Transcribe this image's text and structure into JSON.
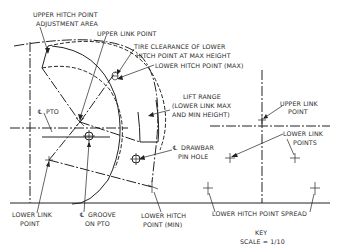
{
  "diagram": {
    "labels": {
      "upper_hitch_adjust_1": "UPPER HITCH POINT",
      "upper_hitch_adjust_2": "ADJUSTMENT AREA",
      "upper_link_point_left": "UPPER LINK POINT",
      "tire_clearance_1": "TIRE CLEARANCE OF LOWER",
      "tire_clearance_2": "HITCH POINT AT MAX HEIGHT",
      "lower_hitch_max": "LOWER HITCH POINT (MAX)",
      "lift_range_1": "LIFT RANGE",
      "lift_range_2": "(LOWER LINK MAX",
      "lift_range_3": "AND MIN HEIGHT)",
      "pto": "PTO",
      "drawbar_1": "DRAWBAR",
      "drawbar_2": "PIN HOLE",
      "upper_link_point_right_1": "UPPER LINK",
      "upper_link_point_right_2": "POINT",
      "lower_link_points_1": "LOWER LINK",
      "lower_link_points_2": "POINTS",
      "lower_link_point_1": "LOWER LINK",
      "lower_link_point_2": "POINT",
      "groove_pto_1": "GROOVE",
      "groove_pto_2": "ON PTO",
      "lower_hitch_min_1": "LOWER HITCH",
      "lower_hitch_min_2": "POINT (MIN)",
      "lower_hitch_spread": "LOWER HITCH POINT SPREAD",
      "key": "KEY",
      "scale": "SCALE = 1/10"
    },
    "centerline_symbol": "℄",
    "icons": [
      "centerline-symbol",
      "crosshair-circle-icon",
      "arrow-icon"
    ]
  }
}
